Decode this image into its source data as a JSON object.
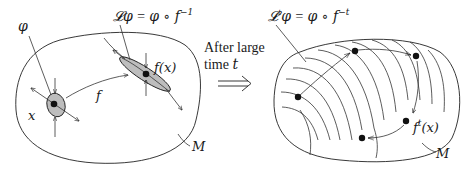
{
  "diagram": {
    "left_panel": {
      "manifold_label": "M",
      "phi_label": "φ",
      "point_label": "x",
      "map_label": "f",
      "image_point_label": "f(x)",
      "operator_formula": {
        "lhs": "𝓛φ",
        "eq": " = ",
        "rhs_base": "φ ∘ f",
        "rhs_exp": "−1"
      }
    },
    "transition": {
      "line1": "After large",
      "line2_word": "time ",
      "line2_var": "t",
      "arrow": "⟹"
    },
    "right_panel": {
      "manifold_label": "M",
      "orbit_point_label_base": "f",
      "orbit_point_label_exp": "t",
      "orbit_point_label_arg": "(x)",
      "operator_formula": {
        "lhs_base": "𝓛",
        "lhs_exp": "t",
        "lhs_func": "φ",
        "eq": " = ",
        "rhs_base": "φ ∘ f",
        "rhs_exp": "−t"
      },
      "orbit_points": [
        {
          "x": 298,
          "y": 97
        },
        {
          "x": 355,
          "y": 51
        },
        {
          "x": 416,
          "y": 56
        },
        {
          "x": 406,
          "y": 121
        },
        {
          "x": 362,
          "y": 138
        }
      ]
    },
    "colors": {
      "ink": "#222222",
      "ellipse_fill": "#bdbdbd",
      "background": "#ffffff"
    }
  }
}
